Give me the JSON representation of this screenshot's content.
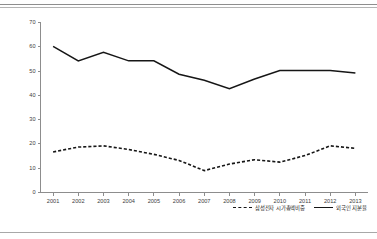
{
  "chart_data": {
    "type": "line",
    "title": "",
    "xlabel": "",
    "ylabel": "",
    "categories": [
      "2001",
      "2002",
      "2003",
      "2004",
      "2005",
      "2006",
      "2007",
      "2008",
      "2009",
      "2010",
      "2011",
      "2012",
      "2013"
    ],
    "ylim": [
      0,
      70
    ],
    "yticks": [
      0,
      10,
      20,
      30,
      40,
      50,
      60,
      70
    ],
    "ytick_labels": [
      "0",
      "10",
      "20",
      "30",
      "40",
      "50",
      "60",
      "70"
    ],
    "grid": false,
    "legend_position": "bottom-right",
    "series": [
      {
        "name": "삼성전자 시가총액비중",
        "style": "dashed",
        "color": "#161616",
        "values": [
          16.5,
          18.5,
          19.0,
          17.5,
          15.5,
          13.0,
          8.8,
          11.5,
          13.3,
          12.3,
          15.0,
          19.0,
          18.0
        ]
      },
      {
        "name": "외국인 지분율",
        "style": "solid",
        "color": "#161616",
        "values": [
          60.0,
          54.0,
          57.5,
          54.0,
          54.0,
          48.5,
          46.0,
          42.5,
          46.5,
          50.0,
          50.0,
          50.0,
          49.0
        ]
      }
    ]
  },
  "legend": {
    "entries": [
      {
        "label": "삼성전자 시가총액비중",
        "style": "dashed"
      },
      {
        "label": "외국인 지분율",
        "style": "solid"
      }
    ]
  },
  "axis": {
    "y_labels": [
      "70",
      "60",
      "50",
      "40",
      "30",
      "20",
      "10",
      "0"
    ],
    "x_labels": [
      "2001",
      "2002",
      "2003",
      "2004",
      "2005",
      "2006",
      "2007",
      "2008",
      "2009",
      "2010",
      "2011",
      "2012",
      "2013"
    ]
  },
  "colors": {
    "line": "#161616",
    "axis": "#8d8d8d",
    "rule": "#9a9a9a",
    "background": "#ffffff"
  }
}
